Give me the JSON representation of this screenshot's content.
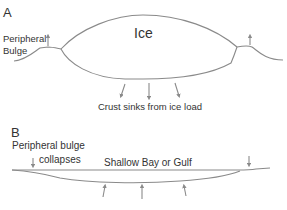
{
  "panel_a": {
    "label": "A",
    "ice_label": "Ice",
    "bulge_label_line1": "Peripheral",
    "bulge_label_line2": "Bulge",
    "crust_label": "Crust sinks from ice load"
  },
  "panel_b": {
    "label": "B",
    "bulge_label_line1": "Peripheral bulge",
    "bulge_label_line2": "collapses",
    "water_label": "Shallow Bay or Gulf"
  },
  "colors": {
    "line": "#8a8a8a",
    "text": "#333333"
  }
}
